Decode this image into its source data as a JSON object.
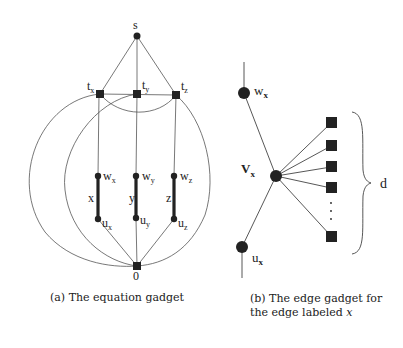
{
  "figure": {
    "left": {
      "caption": "(a) The equation gadget",
      "nodes": {
        "s": "s",
        "tx": {
          "base": "t",
          "sub": "x"
        },
        "ty": {
          "base": "t",
          "sub": "y"
        },
        "tz": {
          "base": "t",
          "sub": "z"
        },
        "wx": {
          "base": "w",
          "sub": "x"
        },
        "wy": {
          "base": "w",
          "sub": "y"
        },
        "wz": {
          "base": "w",
          "sub": "z"
        },
        "ux": {
          "base": "u",
          "sub": "x"
        },
        "uy": {
          "base": "u",
          "sub": "y"
        },
        "uz": {
          "base": "u",
          "sub": "z"
        },
        "zero": "0"
      },
      "edge_labels": {
        "x": "x",
        "y": "y",
        "z": "z"
      }
    },
    "right": {
      "caption_line1": "(b) The edge gadget for",
      "caption_line2": "the edge labeled ",
      "caption_var": "x",
      "nodes": {
        "w": {
          "base": "w",
          "sub": "x"
        },
        "v": {
          "base": "V",
          "sub": "x"
        },
        "u": {
          "base": "u",
          "sub": "x"
        }
      },
      "brace_label": "d",
      "square_count_label": "d"
    }
  }
}
